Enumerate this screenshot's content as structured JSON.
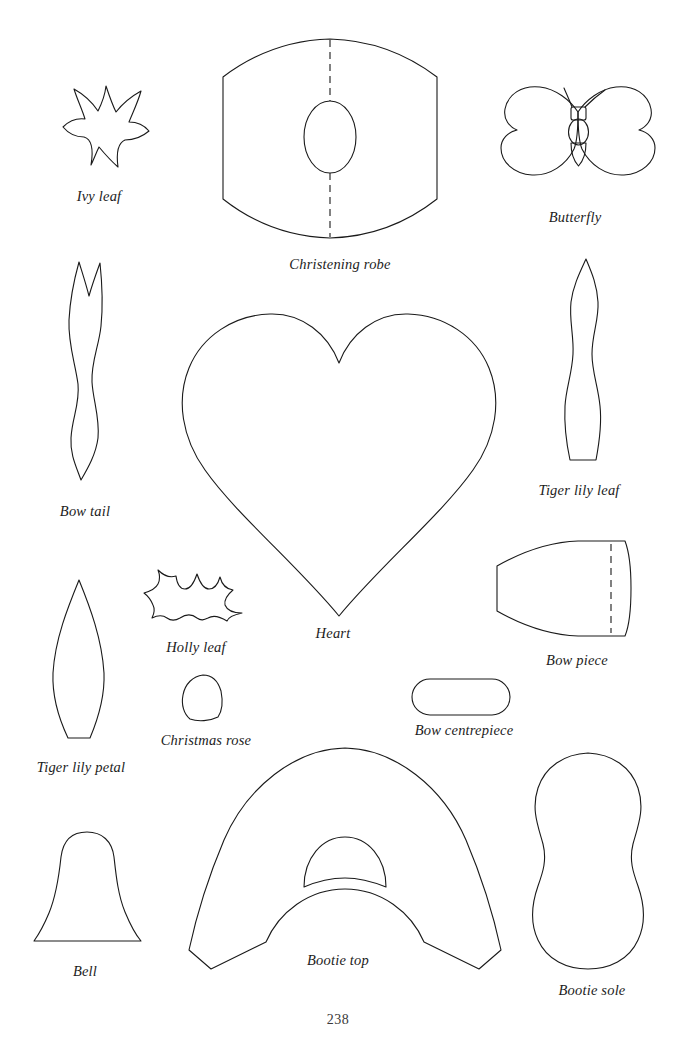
{
  "page": {
    "number": "238",
    "background_color": "#ffffff",
    "ink_color": "#1a1a1a"
  },
  "templates": [
    {
      "id": "ivy-leaf",
      "label": "Ivy leaf",
      "label_x": 99,
      "label_y": 188,
      "shape": "five-pointed-leaf"
    },
    {
      "id": "christening-robe",
      "label": "Christening robe",
      "label_x": 340,
      "label_y": 256,
      "shape": "hexagonal-robe-with-neck-oval",
      "has_dashed_fold_line": true
    },
    {
      "id": "butterfly",
      "label": "Butterfly",
      "label_x": 575,
      "label_y": 209,
      "shape": "butterfly-wings-body-antennae"
    },
    {
      "id": "bow-tail",
      "label": "Bow tail",
      "label_x": 85,
      "label_y": 503,
      "shape": "wavy-ribbon-with-notch"
    },
    {
      "id": "heart",
      "label": "Heart",
      "label_x": 333,
      "label_y": 625,
      "shape": "heart"
    },
    {
      "id": "tiger-lily-leaf",
      "label": "Tiger lily leaf",
      "label_x": 579,
      "label_y": 482,
      "shape": "long-pointed-leaf"
    },
    {
      "id": "holly-leaf",
      "label": "Holly leaf",
      "label_x": 196,
      "label_y": 639,
      "shape": "spiky-holly-leaf"
    },
    {
      "id": "bow-piece",
      "label": "Bow piece",
      "label_x": 577,
      "label_y": 652,
      "shape": "tapered-bow-piece",
      "has_dashed_fold_line": true
    },
    {
      "id": "tiger-lily-petal",
      "label": "Tiger lily petal",
      "label_x": 81,
      "label_y": 759,
      "shape": "pointed-petal"
    },
    {
      "id": "christmas-rose",
      "label": "Christmas rose",
      "label_x": 206,
      "label_y": 732,
      "shape": "small-rounded-petal"
    },
    {
      "id": "bow-centrepiece",
      "label": "Bow centrepiece",
      "label_x": 464,
      "label_y": 722,
      "shape": "rounded-rectangle"
    },
    {
      "id": "bell",
      "label": "Bell",
      "label_x": 85,
      "label_y": 963,
      "shape": "bell"
    },
    {
      "id": "bootie-top",
      "label": "Bootie top",
      "label_x": 338,
      "label_y": 960,
      "shape": "arched-bootie-upper-with-opening"
    },
    {
      "id": "bootie-sole",
      "label": "Bootie sole",
      "label_x": 592,
      "label_y": 982,
      "shape": "foot-sole-outline"
    }
  ]
}
